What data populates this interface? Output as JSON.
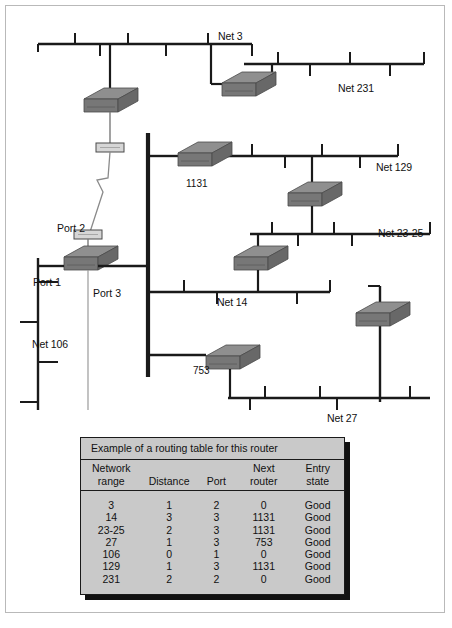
{
  "figure": {
    "caption": ""
  },
  "networks": [
    {
      "id": "net3",
      "label": "Net 3"
    },
    {
      "id": "net231",
      "label": "Net 231"
    },
    {
      "id": "net129",
      "label": "Net 129"
    },
    {
      "id": "net23_25",
      "label": "Net 23-25"
    },
    {
      "id": "net14",
      "label": "Net 14"
    },
    {
      "id": "net106",
      "label": "Net 106"
    },
    {
      "id": "net27",
      "label": "Net 27"
    }
  ],
  "ports": [
    {
      "id": "port1",
      "label": "Port 1"
    },
    {
      "id": "port2",
      "label": "Port 2"
    },
    {
      "id": "port3",
      "label": "Port 3"
    }
  ],
  "routers": [
    {
      "id": "router1131",
      "label": "1131"
    },
    {
      "id": "router753",
      "label": "753"
    }
  ],
  "table": {
    "title": "Example of a routing table for this router",
    "columns": [
      {
        "line1": "Network",
        "line2": "range"
      },
      {
        "line1": "",
        "line2": "Distance"
      },
      {
        "line1": "",
        "line2": "Port"
      },
      {
        "line1": "Next",
        "line2": "router"
      },
      {
        "line1": "Entry",
        "line2": "state"
      }
    ],
    "rows": [
      {
        "range": "3",
        "distance": "1",
        "port": "2",
        "next_router": "0",
        "entry_state": "Good"
      },
      {
        "range": "14",
        "distance": "3",
        "port": "3",
        "next_router": "1131",
        "entry_state": "Good"
      },
      {
        "range": "23-25",
        "distance": "2",
        "port": "3",
        "next_router": "1131",
        "entry_state": "Good"
      },
      {
        "range": "27",
        "distance": "1",
        "port": "3",
        "next_router": "753",
        "entry_state": "Good"
      },
      {
        "range": "106",
        "distance": "0",
        "port": "1",
        "next_router": "0",
        "entry_state": "Good"
      },
      {
        "range": "129",
        "distance": "1",
        "port": "3",
        "next_router": "1131",
        "entry_state": "Good"
      },
      {
        "range": "231",
        "distance": "2",
        "port": "2",
        "next_router": "0",
        "entry_state": "Good"
      }
    ]
  },
  "colors": {
    "bus": "#1a1a1a",
    "router_top": "#8a8a8a",
    "router_front": "#7a7a7a",
    "router_side": "#6b6b6b",
    "table_bg": "#c9c9c9",
    "frame": "#b9b9b9",
    "transceiver": "#d6d6d6"
  }
}
